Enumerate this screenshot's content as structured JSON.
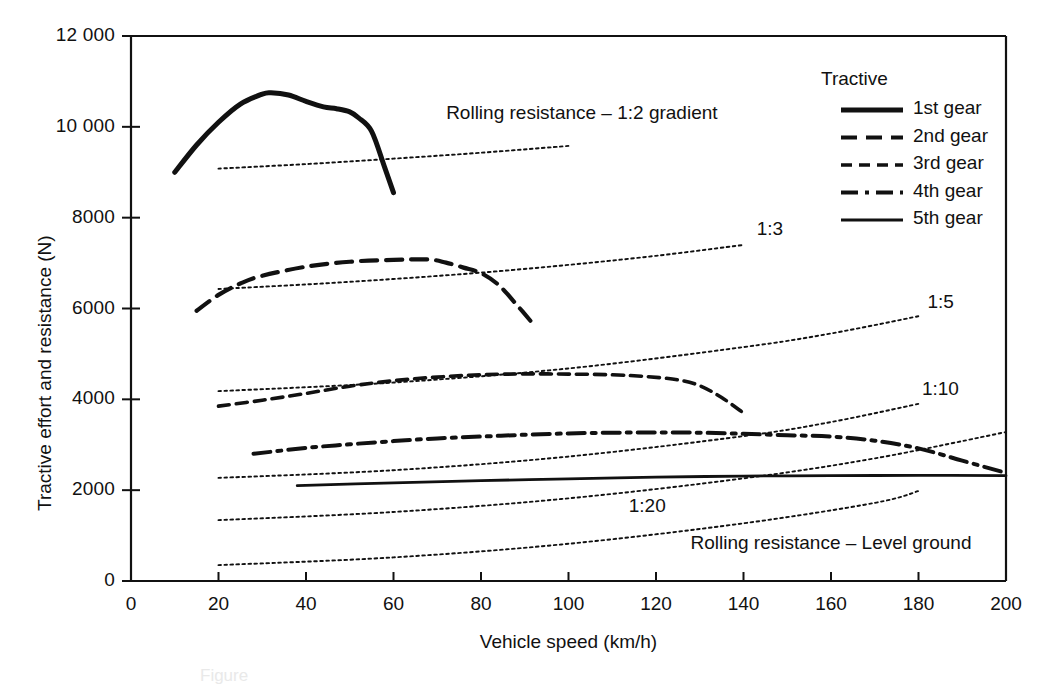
{
  "chart_data": {
    "type": "line",
    "title": "",
    "xlabel": "Vehicle speed (km/h)",
    "ylabel": "Tractive effort and resistance (N)",
    "xlim": [
      0,
      200
    ],
    "ylim": [
      0,
      12000
    ],
    "xticks": [
      "0",
      "20",
      "40",
      "60",
      "80",
      "100",
      "120",
      "140",
      "160",
      "180",
      "200"
    ],
    "yticks": [
      "0",
      "2000",
      "4000",
      "6000",
      "8000",
      "10 000",
      "12 000"
    ],
    "xtick_values": [
      0,
      20,
      40,
      60,
      80,
      100,
      120,
      140,
      160,
      180,
      200
    ],
    "ytick_values": [
      0,
      2000,
      4000,
      6000,
      8000,
      10000,
      12000
    ],
    "grid": false,
    "legend_position": "top-right",
    "legend_title": "Tractive",
    "series": [
      {
        "name": "1st gear",
        "style": "solid-thick",
        "x": [
          10,
          15,
          20,
          25,
          30,
          32,
          36,
          40,
          44,
          47,
          50,
          52,
          55,
          58,
          60
        ],
        "values": [
          9000,
          9600,
          10100,
          10500,
          10720,
          10750,
          10700,
          10560,
          10440,
          10400,
          10330,
          10200,
          9900,
          9100,
          8550
        ]
      },
      {
        "name": "2nd gear",
        "style": "dashed",
        "x": [
          15,
          20,
          25,
          30,
          40,
          50,
          60,
          68,
          72,
          76,
          80,
          84,
          88,
          92
        ],
        "values": [
          5950,
          6300,
          6550,
          6720,
          6920,
          7030,
          7070,
          7080,
          7010,
          6900,
          6780,
          6520,
          6100,
          5650
        ]
      },
      {
        "name": "3rd gear",
        "style": "dashed-medium",
        "x": [
          20,
          30,
          40,
          50,
          60,
          70,
          80,
          90,
          100,
          110,
          118,
          125,
          130,
          135,
          140
        ],
        "values": [
          3850,
          3980,
          4130,
          4290,
          4410,
          4490,
          4540,
          4560,
          4555,
          4540,
          4500,
          4430,
          4300,
          4040,
          3700
        ]
      },
      {
        "name": "4th gear",
        "style": "dash-dot",
        "x": [
          28,
          40,
          50,
          60,
          70,
          80,
          90,
          100,
          110,
          120,
          130,
          140,
          150,
          160,
          170,
          180,
          190,
          200
        ],
        "values": [
          2800,
          2930,
          3010,
          3080,
          3140,
          3180,
          3220,
          3250,
          3265,
          3270,
          3265,
          3240,
          3210,
          3180,
          3090,
          2920,
          2650,
          2380
        ]
      },
      {
        "name": "5th gear",
        "style": "solid",
        "x": [
          38,
          60,
          80,
          100,
          120,
          140,
          160,
          180,
          200
        ],
        "values": [
          2100,
          2160,
          2210,
          2250,
          2285,
          2310,
          2320,
          2325,
          2320
        ]
      }
    ],
    "resistance_lines": [
      {
        "name": "Rolling resistance - 1:2 gradient",
        "label": "Rolling resistance – 1:2 gradient",
        "style": "dotted",
        "x": [
          20,
          40,
          60,
          80,
          100
        ],
        "values": [
          9080,
          9180,
          9300,
          9430,
          9580
        ]
      },
      {
        "name": "1:3 gradient",
        "label": "1:3",
        "style": "dotted",
        "x": [
          20,
          40,
          60,
          80,
          100,
          120,
          140
        ],
        "values": [
          6430,
          6530,
          6650,
          6790,
          6960,
          7160,
          7400
        ]
      },
      {
        "name": "1:5 gradient",
        "label": "1:5",
        "style": "dotted",
        "x": [
          20,
          60,
          100,
          140,
          160,
          180
        ],
        "values": [
          4180,
          4370,
          4680,
          5150,
          5450,
          5830
        ]
      },
      {
        "name": "1:10 gradient",
        "label": "1:10",
        "style": "dotted",
        "x": [
          20,
          60,
          100,
          140,
          160,
          180
        ],
        "values": [
          2270,
          2440,
          2740,
          3190,
          3500,
          3900
        ]
      },
      {
        "name": "1:20 gradient",
        "label": "1:20",
        "style": "dotted",
        "x": [
          20,
          60,
          100,
          140,
          170,
          200
        ],
        "values": [
          1340,
          1520,
          1820,
          2260,
          2700,
          3280
        ]
      },
      {
        "name": "Rolling resistance - Level ground",
        "label": "Rolling resistance – Level ground",
        "style": "dotted",
        "x": [
          20,
          60,
          100,
          140,
          170,
          180
        ],
        "values": [
          350,
          520,
          820,
          1270,
          1720,
          1980
        ]
      }
    ],
    "annotations": [
      {
        "text": "Rolling resistance – 1:2 gradient",
        "x": 103,
        "y": 10290
      },
      {
        "text": "1:3",
        "x": 146,
        "y": 7720
      },
      {
        "text": "1:5",
        "x": 185,
        "y": 6130
      },
      {
        "text": "1:10",
        "x": 185,
        "y": 4200
      },
      {
        "text": "1:20",
        "x": 118,
        "y": 1620
      },
      {
        "text": "Rolling resistance – Level ground",
        "x": 160,
        "y": 820
      }
    ]
  },
  "legend": {
    "title": "Tractive",
    "items": [
      {
        "label": "1st gear",
        "style": "solid-thick"
      },
      {
        "label": "2nd gear",
        "style": "dashed"
      },
      {
        "label": "3rd gear",
        "style": "dashed-medium"
      },
      {
        "label": "4th gear",
        "style": "dash-dot"
      },
      {
        "label": "5th gear",
        "style": "solid"
      }
    ]
  },
  "axes": {
    "x_title": "Vehicle speed (km/h)",
    "y_title": "Tractive effort and resistance (N)"
  },
  "colors": {
    "ink": "#111111",
    "background": "#ffffff"
  },
  "caption": {
    "text": "Figure"
  }
}
